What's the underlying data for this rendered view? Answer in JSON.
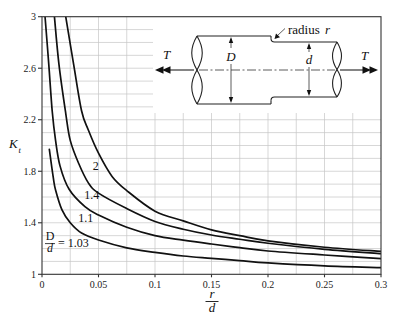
{
  "figure": {
    "ylabel": {
      "main": "K",
      "sub": "t"
    },
    "xlabel": {
      "numerator": "r",
      "denominator": "d"
    },
    "ratio_label": {
      "numerator": "D",
      "denominator": "d",
      "suffix": "= 1.03"
    }
  },
  "diagram": {
    "load_left": "T",
    "load_right": "T",
    "large_diameter": "D",
    "small_diameter": "d",
    "fillet_text": "radius",
    "fillet_symbol": "r"
  },
  "chart_data": {
    "type": "line",
    "title": "",
    "xlabel": "r/d",
    "ylabel": "K_t",
    "xlim": [
      0,
      0.3
    ],
    "ylim": [
      1,
      3
    ],
    "xticks": [
      0,
      0.05,
      0.1,
      0.15,
      0.2,
      0.25,
      0.3
    ],
    "xtick_labels": [
      "0",
      "0.05",
      "0.1",
      "0.15",
      "0.2",
      "0.25",
      "0.3"
    ],
    "yticks": [
      1,
      1.4,
      1.8,
      2.2,
      2.6,
      3
    ],
    "ytick_labels": [
      "1",
      "1.4",
      "1.8",
      "2.2",
      "2.6",
      "3"
    ],
    "grid": {
      "on": true,
      "x_step": 0.025,
      "y_step": 0.1
    },
    "series": [
      {
        "name": "D/d = 2",
        "label": "2",
        "label_at": [
          0.0475,
          1.81
        ],
        "points": [
          [
            0.021,
            3.0
          ],
          [
            0.028,
            2.63
          ],
          [
            0.035,
            2.27
          ],
          [
            0.041,
            2.12
          ],
          [
            0.05,
            1.94
          ],
          [
            0.062,
            1.76
          ],
          [
            0.075,
            1.65
          ],
          [
            0.1,
            1.49
          ],
          [
            0.125,
            1.415
          ],
          [
            0.15,
            1.345
          ],
          [
            0.175,
            1.3
          ],
          [
            0.2,
            1.26
          ],
          [
            0.25,
            1.21
          ],
          [
            0.3,
            1.178
          ]
        ]
      },
      {
        "name": "D/d = 1.4",
        "label": "1.4",
        "label_at": [
          0.044,
          1.581
        ],
        "points": [
          [
            0.011,
            3.0
          ],
          [
            0.015,
            2.63
          ],
          [
            0.021,
            2.25
          ],
          [
            0.025,
            2.04
          ],
          [
            0.0325,
            1.86
          ],
          [
            0.041,
            1.71
          ],
          [
            0.05,
            1.63
          ],
          [
            0.075,
            1.51
          ],
          [
            0.1,
            1.41
          ],
          [
            0.125,
            1.35
          ],
          [
            0.15,
            1.305
          ],
          [
            0.175,
            1.272
          ],
          [
            0.2,
            1.241
          ],
          [
            0.25,
            1.194
          ],
          [
            0.3,
            1.16
          ]
        ]
      },
      {
        "name": "D/d = 1.1",
        "label": "1.1",
        "label_at": [
          0.0387,
          1.406
        ],
        "points": [
          [
            0.0027,
            3.0
          ],
          [
            0.006,
            2.63
          ],
          [
            0.009,
            2.27
          ],
          [
            0.012,
            2.04
          ],
          [
            0.016,
            1.84
          ],
          [
            0.024,
            1.66
          ],
          [
            0.038,
            1.525
          ],
          [
            0.05,
            1.46
          ],
          [
            0.075,
            1.365
          ],
          [
            0.1,
            1.3
          ],
          [
            0.125,
            1.265
          ],
          [
            0.15,
            1.235
          ],
          [
            0.175,
            1.207
          ],
          [
            0.2,
            1.181
          ],
          [
            0.25,
            1.15
          ],
          [
            0.3,
            1.122
          ]
        ]
      },
      {
        "name": "D/d = 1.03",
        "label": "1.03",
        "points": [
          [
            0.0065,
            1.97
          ],
          [
            0.01,
            1.75
          ],
          [
            0.012,
            1.655
          ],
          [
            0.0177,
            1.5
          ],
          [
            0.025,
            1.4
          ],
          [
            0.035,
            1.32
          ],
          [
            0.05,
            1.266
          ],
          [
            0.075,
            1.205
          ],
          [
            0.1,
            1.17
          ],
          [
            0.125,
            1.142
          ],
          [
            0.15,
            1.124
          ],
          [
            0.175,
            1.106
          ],
          [
            0.2,
            1.088
          ],
          [
            0.25,
            1.065
          ],
          [
            0.3,
            1.052
          ]
        ]
      }
    ]
  }
}
